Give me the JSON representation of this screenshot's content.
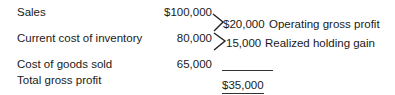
{
  "rows": [
    {
      "label": "Sales",
      "amount": "$100,000"
    },
    {
      "label": "Current cost of inventory",
      "amount": "80,000"
    },
    {
      "label": "Cost of goods sold",
      "amount": "65,000"
    },
    {
      "label": "Total gross profit",
      "amount": ""
    }
  ],
  "differences": [
    {
      "amount": "$20,000",
      "label": "Operating gross profit"
    },
    {
      "amount": "15,000",
      "label": "Realized holding gain"
    }
  ],
  "total": "$35,000"
}
